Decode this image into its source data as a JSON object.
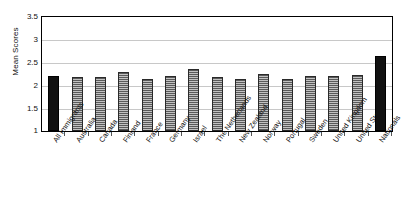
{
  "chart_data": {
    "type": "bar",
    "title": "",
    "xlabel": "",
    "ylabel": "Mean Scores",
    "ylim": [
      1,
      3.5
    ],
    "ytick_labels": [
      "3.5",
      "3",
      "2.5",
      "2",
      "1.5",
      "1"
    ],
    "ytick_values": [
      3.5,
      3,
      2.5,
      2,
      1.5,
      1
    ],
    "grid": true,
    "legend": "none",
    "categories": [
      "All Immigrants",
      "Australia",
      "Canada",
      "Finland",
      "France",
      "Germany",
      "Israel",
      "The Netherlands",
      "New Zealand",
      "Norway",
      "Portugal",
      "Sweden",
      "United Kingdom",
      "United States",
      "Nationals"
    ],
    "values": [
      2.2,
      2.18,
      2.19,
      2.3,
      2.15,
      2.2,
      2.35,
      2.18,
      2.15,
      2.25,
      2.15,
      2.2,
      2.2,
      2.22,
      2.65
    ],
    "highlighted": [
      0,
      14
    ],
    "series_styles": {
      "highlight_fill": "#111111",
      "default_fill": "#8d8d8d",
      "gridline_color": "#c8c8c8",
      "axis_color": "#000000"
    }
  }
}
